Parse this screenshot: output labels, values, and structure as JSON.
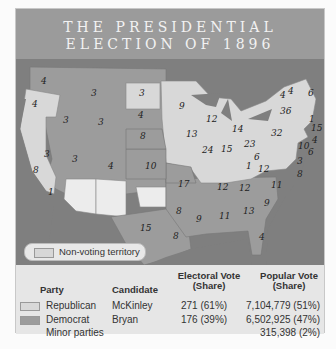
{
  "title": {
    "line1": "THE PRESIDENTIAL",
    "line2": "ELECTION OF 1896"
  },
  "colors": {
    "republican": "#d8d8d8",
    "democrat": "#9c9c9c",
    "non_voting": "#ececec",
    "water": "#7f7f7f"
  },
  "map": {
    "legend": {
      "label": "Non-voting territory"
    },
    "electoral_votes": [
      {
        "label": "4",
        "x": 25,
        "y": 25
      },
      {
        "label": "4",
        "x": 16,
        "y": 48
      },
      {
        "label": "3",
        "x": 75,
        "y": 37
      },
      {
        "label": "3",
        "x": 123,
        "y": 37
      },
      {
        "label": "9",
        "x": 163,
        "y": 50
      },
      {
        "label": "3",
        "x": 47,
        "y": 64
      },
      {
        "label": "3",
        "x": 82,
        "y": 66
      },
      {
        "label": "4",
        "x": 122,
        "y": 59
      },
      {
        "label": "8",
        "x": 124,
        "y": 80
      },
      {
        "label": "13",
        "x": 170,
        "y": 78
      },
      {
        "label": "12",
        "x": 190,
        "y": 63
      },
      {
        "label": "14",
        "x": 216,
        "y": 73
      },
      {
        "label": "36",
        "x": 264,
        "y": 55
      },
      {
        "label": "32",
        "x": 255,
        "y": 77
      },
      {
        "label": "3",
        "x": 28,
        "y": 98
      },
      {
        "label": "3",
        "x": 56,
        "y": 103
      },
      {
        "label": "4",
        "x": 92,
        "y": 110
      },
      {
        "label": "10",
        "x": 129,
        "y": 110
      },
      {
        "label": "24",
        "x": 186,
        "y": 94
      },
      {
        "label": "15",
        "x": 205,
        "y": 93
      },
      {
        "label": "23",
        "x": 228,
        "y": 88
      },
      {
        "label": "6",
        "x": 238,
        "y": 101
      },
      {
        "label": "1",
        "x": 230,
        "y": 110
      },
      {
        "label": "12",
        "x": 242,
        "y": 113
      },
      {
        "label": "12",
        "x": 201,
        "y": 131
      },
      {
        "label": "17",
        "x": 162,
        "y": 128
      },
      {
        "label": "12",
        "x": 223,
        "y": 132
      },
      {
        "label": "11",
        "x": 255,
        "y": 129
      },
      {
        "label": "8",
        "x": 17,
        "y": 114
      },
      {
        "label": "1",
        "x": 32,
        "y": 136
      },
      {
        "label": "8",
        "x": 160,
        "y": 155
      },
      {
        "label": "9",
        "x": 180,
        "y": 163
      },
      {
        "label": "11",
        "x": 203,
        "y": 160
      },
      {
        "label": "13",
        "x": 227,
        "y": 155
      },
      {
        "label": "9",
        "x": 248,
        "y": 147
      },
      {
        "label": "8",
        "x": 157,
        "y": 180
      },
      {
        "label": "15",
        "x": 124,
        "y": 172
      },
      {
        "label": "4",
        "x": 243,
        "y": 181
      },
      {
        "label": "4",
        "x": 264,
        "y": 39
      },
      {
        "label": "4",
        "x": 272,
        "y": 35
      },
      {
        "label": "6",
        "x": 292,
        "y": 37
      },
      {
        "label": "15",
        "x": 295,
        "y": 72
      },
      {
        "label": "4",
        "x": 296,
        "y": 84
      },
      {
        "label": "6",
        "x": 292,
        "y": 96
      },
      {
        "label": "10",
        "x": 282,
        "y": 90
      },
      {
        "label": "3",
        "x": 281,
        "y": 105
      },
      {
        "label": "8",
        "x": 281,
        "y": 118
      },
      {
        "label": "1",
        "x": 293,
        "y": 63
      }
    ]
  },
  "table": {
    "headers": {
      "party": "Party",
      "candidate": "Candidate",
      "electoral_line1": "Electoral Vote",
      "electoral_line2": "(Share)",
      "popular_line1": "Popular Vote",
      "popular_line2": "(Share)"
    },
    "rows": [
      {
        "party": "Republican",
        "candidate": "McKinley",
        "electoral": "271 (61%)",
        "popular": "7,104,779 (51%)"
      },
      {
        "party": "Democrat",
        "candidate": "Bryan",
        "electoral": "176 (39%)",
        "popular": "6,502,925 (47%)"
      },
      {
        "party": "Minor parties",
        "candidate": "",
        "electoral": "",
        "popular": "315,398 (2%)"
      }
    ]
  }
}
